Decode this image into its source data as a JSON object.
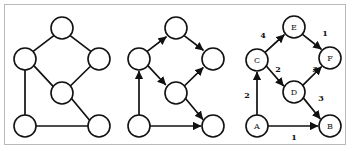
{
  "figure": {
    "title": "",
    "background_color": "#ffffff",
    "frame_border_color": "#b9b9b9",
    "stroke_color": "#111111",
    "node_fill": "#ffffff"
  },
  "panels": [
    {
      "id": "undirected-graph",
      "name": "Undirected graph",
      "directed": false,
      "weighted": false,
      "labeled": false,
      "nodes": [
        {
          "id": "n-top",
          "label": "",
          "cx": 57,
          "cy": 23
        },
        {
          "id": "n-left",
          "label": "",
          "cx": 20,
          "cy": 54
        },
        {
          "id": "n-right",
          "label": "",
          "cx": 94,
          "cy": 54
        },
        {
          "id": "n-mid",
          "label": "",
          "cx": 57,
          "cy": 88
        },
        {
          "id": "n-bleft",
          "label": "",
          "cx": 20,
          "cy": 121
        },
        {
          "id": "n-bright",
          "label": "",
          "cx": 94,
          "cy": 121
        }
      ],
      "edges": [
        {
          "from": "n-left",
          "to": "n-top",
          "weight": null
        },
        {
          "from": "n-top",
          "to": "n-right",
          "weight": null
        },
        {
          "from": "n-left",
          "to": "n-mid",
          "weight": null
        },
        {
          "from": "n-mid",
          "to": "n-right",
          "weight": null
        },
        {
          "from": "n-left",
          "to": "n-bleft",
          "weight": null
        },
        {
          "from": "n-mid",
          "to": "n-bright",
          "weight": null
        },
        {
          "from": "n-bleft",
          "to": "n-bright",
          "weight": null
        }
      ]
    },
    {
      "id": "directed-graph",
      "name": "Directed graph",
      "directed": true,
      "weighted": false,
      "labeled": false,
      "nodes": [
        {
          "id": "d-top",
          "label": "",
          "cx": 57,
          "cy": 23
        },
        {
          "id": "d-left",
          "label": "",
          "cx": 20,
          "cy": 54
        },
        {
          "id": "d-right",
          "label": "",
          "cx": 94,
          "cy": 54
        },
        {
          "id": "d-mid",
          "label": "",
          "cx": 57,
          "cy": 88
        },
        {
          "id": "d-bleft",
          "label": "",
          "cx": 20,
          "cy": 121
        },
        {
          "id": "d-bright",
          "label": "",
          "cx": 94,
          "cy": 121
        }
      ],
      "edges": [
        {
          "from": "d-left",
          "to": "d-top",
          "weight": null
        },
        {
          "from": "d-top",
          "to": "d-right",
          "weight": null
        },
        {
          "from": "d-left",
          "to": "d-mid",
          "weight": null
        },
        {
          "from": "d-mid",
          "to": "d-right",
          "weight": null
        },
        {
          "from": "d-bleft",
          "to": "d-left",
          "weight": null
        },
        {
          "from": "d-mid",
          "to": "d-bright",
          "weight": null
        },
        {
          "from": "d-bleft",
          "to": "d-bright",
          "weight": null
        }
      ]
    },
    {
      "id": "weighted-graph",
      "name": "Weighted directed graph",
      "directed": true,
      "weighted": true,
      "labeled": true,
      "nodes": [
        {
          "id": "E",
          "label": "E",
          "cx": 61,
          "cy": 22
        },
        {
          "id": "F",
          "label": "F",
          "cx": 97,
          "cy": 53
        },
        {
          "id": "C",
          "label": "C",
          "cx": 24,
          "cy": 55
        },
        {
          "id": "D",
          "label": "D",
          "cx": 61,
          "cy": 87
        },
        {
          "id": "A",
          "label": "A",
          "cx": 24,
          "cy": 121
        },
        {
          "id": "B",
          "label": "B",
          "cx": 97,
          "cy": 121
        }
      ],
      "edges": [
        {
          "from": "C",
          "to": "E",
          "weight": "4",
          "lx": 30,
          "ly": 30
        },
        {
          "from": "E",
          "to": "F",
          "weight": "1",
          "lx": 92,
          "ly": 28
        },
        {
          "from": "A",
          "to": "C",
          "weight": "2",
          "lx": 14,
          "ly": 90
        },
        {
          "from": "C",
          "to": "D",
          "weight": "2",
          "lx": 45,
          "ly": 64
        },
        {
          "from": "D",
          "to": "F",
          "weight": "3",
          "lx": 82,
          "ly": 64
        },
        {
          "from": "D",
          "to": "B",
          "weight": "3",
          "lx": 88,
          "ly": 93
        },
        {
          "from": "A",
          "to": "B",
          "weight": "1",
          "lx": 61,
          "ly": 132
        }
      ]
    }
  ]
}
